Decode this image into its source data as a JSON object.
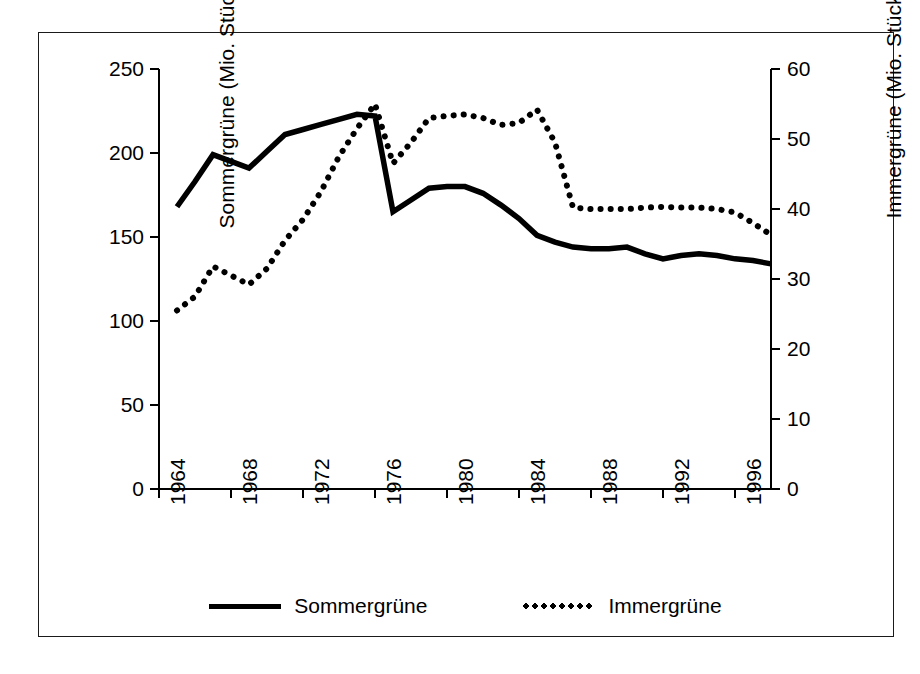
{
  "chart_data": {
    "type": "line",
    "title": "",
    "subtitle": "",
    "xlabel": "",
    "ylabel": "Sommergrüne (Mio. Stück)",
    "y2label": "Immergrüne (Mio. Stück)",
    "grid": false,
    "legend_position": "bottom",
    "xlim": [
      1964,
      1998
    ],
    "ylim": [
      0,
      250
    ],
    "y2lim": [
      0,
      60
    ],
    "xticks": [
      1964,
      1968,
      1972,
      1976,
      1980,
      1984,
      1988,
      1992,
      1996
    ],
    "xticklabels": [
      "1964",
      "1968",
      "1972",
      "1976",
      "1980",
      "1984",
      "1988",
      "1992",
      "1996"
    ],
    "yticks": [
      0,
      50,
      100,
      150,
      200,
      250
    ],
    "yticklabels": [
      "0",
      "50",
      "100",
      "150",
      "200",
      "250"
    ],
    "y2ticks": [
      0,
      10,
      20,
      30,
      40,
      50,
      60
    ],
    "y2ticklabels": [
      "0",
      "10",
      "20",
      "30",
      "40",
      "50",
      "60"
    ],
    "x": [
      1965,
      1966,
      1967,
      1968,
      1969,
      1970,
      1971,
      1972,
      1973,
      1974,
      1975,
      1976,
      1977,
      1978,
      1979,
      1980,
      1981,
      1982,
      1983,
      1984,
      1985,
      1986,
      1987,
      1988,
      1989,
      1990,
      1991,
      1992,
      1993,
      1994,
      1995,
      1996,
      1997,
      1998
    ],
    "series": [
      {
        "name": "Sommergrüne",
        "axis": "left",
        "style": "solid",
        "color": "#000000",
        "values": [
          168,
          183,
          199,
          195,
          191,
          201,
          211,
          214,
          217,
          220,
          223,
          222,
          165,
          172,
          179,
          180,
          180,
          176,
          169,
          161,
          151,
          147,
          144,
          143,
          143,
          144,
          140,
          137,
          139,
          140,
          139,
          137,
          136,
          134
        ]
      },
      {
        "name": "Immergrüne",
        "axis": "right",
        "style": "dotted",
        "color": "#000000",
        "values": [
          25.5,
          27.5,
          31.8,
          30.5,
          29.2,
          31.5,
          35.5,
          38.5,
          42.5,
          47.5,
          51.5,
          55.0,
          46.5,
          49.5,
          53.0,
          53.3,
          53.5,
          53.0,
          52.0,
          52.3,
          54.2,
          49.5,
          40.2,
          40.0,
          40.0,
          40.0,
          40.2,
          40.3,
          40.2,
          40.2,
          40.0,
          39.5,
          38.0,
          36.3
        ]
      }
    ]
  },
  "legend": {
    "items": [
      {
        "label": "Sommergrüne",
        "style": "solid"
      },
      {
        "label": "Immergrüne",
        "style": "dotted"
      }
    ]
  }
}
